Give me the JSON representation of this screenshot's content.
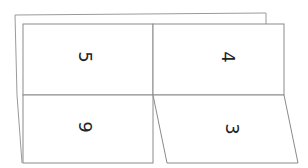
{
  "diagram": {
    "type": "folded-paper",
    "colors": {
      "line": "#8a8a8a",
      "text": "#222222",
      "background": "#ffffff"
    },
    "panels": [
      {
        "id": "top-left",
        "label": "5",
        "rotation": 90
      },
      {
        "id": "top-right",
        "label": "4",
        "rotation": 90
      },
      {
        "id": "bottom-left",
        "label": "9",
        "rotation": 90
      },
      {
        "id": "bottom-right",
        "label": "3",
        "rotation": 90
      }
    ]
  }
}
